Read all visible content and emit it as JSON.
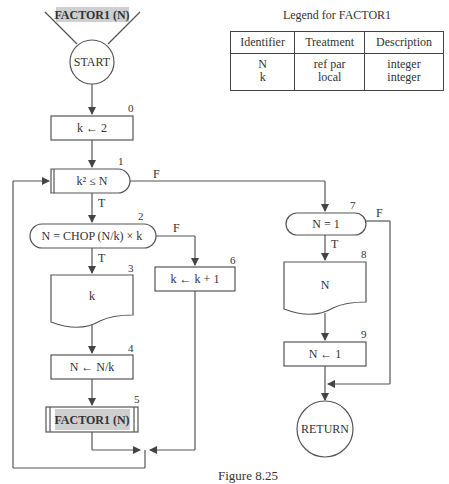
{
  "diagram": {
    "entry": {
      "label": "FACTOR1 (N)"
    },
    "start": {
      "label": "START"
    },
    "nodes": [
      {
        "id": 0,
        "type": "process",
        "label": "k ← 2"
      },
      {
        "id": 1,
        "type": "loop-decision",
        "label": "k² ≤ N",
        "true": "T",
        "false": "F"
      },
      {
        "id": 2,
        "type": "decision",
        "label": "N = CHOP (N/k) × k",
        "true": "T",
        "false": "F"
      },
      {
        "id": 3,
        "type": "output",
        "label": "k"
      },
      {
        "id": 4,
        "type": "process",
        "label": "N ← N/k"
      },
      {
        "id": 5,
        "type": "subroutine-call",
        "label": "FACTOR1 (N)"
      },
      {
        "id": 6,
        "type": "process",
        "label": "k ← k + 1"
      },
      {
        "id": 7,
        "type": "decision",
        "label": "N = 1",
        "true": "T",
        "false": "F"
      },
      {
        "id": 8,
        "type": "output",
        "label": "N"
      },
      {
        "id": 9,
        "type": "process",
        "label": "N ← 1"
      }
    ],
    "end": {
      "label": "RETURN"
    },
    "numbers": [
      "0",
      "1",
      "2",
      "3",
      "4",
      "5",
      "6",
      "7",
      "8",
      "9"
    ],
    "branch_labels": {
      "t": "T",
      "f": "F"
    }
  },
  "legend": {
    "title": "Legend for FACTOR1",
    "headers": [
      "Identifier",
      "Treatment",
      "Description"
    ],
    "rows": [
      [
        "N",
        "ref par",
        "integer"
      ],
      [
        "k",
        "local",
        "integer"
      ]
    ]
  },
  "caption": "Figure 8.25"
}
